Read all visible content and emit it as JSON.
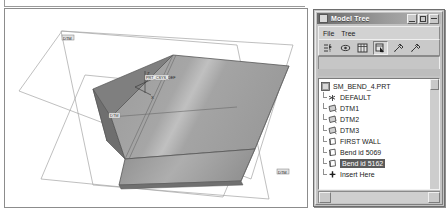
{
  "viewport": {
    "name": "graphics-window",
    "background": "#ffffff",
    "labels": {
      "datum_top": "DTM",
      "datum_right": "DTM",
      "csys": "PRT_CSYS_DEF",
      "axis_x": "X",
      "axis_y": "Y",
      "axis_z": "Z",
      "edge_label": "DTM"
    },
    "colors": {
      "surface_light": "#b0b0b0",
      "surface_mid": "#9a9a9a",
      "surface_dark": "#8a8a8a",
      "surface_darkest": "#6f6f6f",
      "edge": "#5a5a5a",
      "datum_line": "#9b9b9b",
      "border": "#8c8c8c"
    }
  },
  "model_tree": {
    "title": "Model Tree",
    "title_icon": "model-tree-icon",
    "window_buttons": [
      {
        "name": "minimize-button",
        "glyph": "minimize"
      },
      {
        "name": "maximize-button",
        "glyph": "maximize"
      },
      {
        "name": "close-button",
        "glyph": "close"
      }
    ],
    "menu": [
      {
        "label": "File",
        "mnemonic": "F"
      },
      {
        "label": "Tree",
        "mnemonic": "T"
      }
    ],
    "toolbar": [
      {
        "name": "show-tree-filters-icon",
        "pressed": false
      },
      {
        "name": "display-settings-icon",
        "pressed": false
      },
      {
        "name": "tree-columns-icon",
        "pressed": false
      },
      {
        "name": "tree-select-icon",
        "pressed": true
      },
      {
        "name": "tree-tool-1-icon",
        "pressed": false
      },
      {
        "name": "tree-tool-2-icon",
        "pressed": false
      }
    ],
    "items": [
      {
        "label": "SM_BEND_4.PRT",
        "icon": "part-icon",
        "level": 0,
        "selected": false
      },
      {
        "label": "DEFAULT",
        "icon": "coordinate-system-icon",
        "level": 1,
        "selected": false
      },
      {
        "label": "DTM1",
        "icon": "datum-plane-icon",
        "level": 1,
        "selected": false
      },
      {
        "label": "DTM2",
        "icon": "datum-plane-icon",
        "level": 1,
        "selected": false
      },
      {
        "label": "DTM3",
        "icon": "datum-plane-icon",
        "level": 1,
        "selected": false
      },
      {
        "label": "FIRST WALL",
        "icon": "wall-feature-icon",
        "level": 1,
        "selected": false
      },
      {
        "label": "Bend id 5069",
        "icon": "wall-feature-icon",
        "level": 1,
        "selected": false
      },
      {
        "label": "Bend id 5162",
        "icon": "wall-feature-icon",
        "level": 1,
        "selected": true
      },
      {
        "label": "Insert Here",
        "icon": "insert-here-icon",
        "level": 1,
        "selected": false
      }
    ]
  }
}
